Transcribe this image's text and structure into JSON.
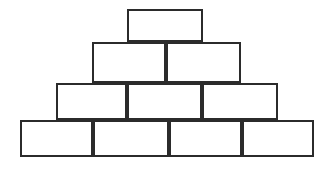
{
  "figure": {
    "name": "brick-pyramid",
    "background_color": "#ffffff",
    "stroke_color": "#2b2b2b",
    "fill_color": "#ffffff",
    "stroke_width": 2,
    "width": 330,
    "height": 169,
    "row_count": 4,
    "brick_count": 10
  },
  "chart_data": {
    "type": "diagram",
    "background_color": "#ffffff",
    "stroke_color": "#2b2b2b",
    "fill_color": "#ffffff",
    "stroke_width": 2,
    "rows": [
      {
        "index": 1,
        "label": "row-1-top",
        "brick_count": 1,
        "y_top": 9,
        "y_bottom": 42,
        "height": 33,
        "x_left": 127,
        "x_right": 203,
        "dividers": [],
        "bricks": [
          {
            "id": "r1b1",
            "x": 127,
            "y": 9,
            "width": 76,
            "height": 33
          }
        ]
      },
      {
        "index": 2,
        "label": "row-2",
        "brick_count": 2,
        "y_top": 42,
        "y_bottom": 83,
        "height": 41,
        "x_left": 92,
        "x_right": 241,
        "dividers": [
          166
        ],
        "bricks": [
          {
            "id": "r2b1",
            "x": 92,
            "y": 42,
            "width": 74,
            "height": 41
          },
          {
            "id": "r2b2",
            "x": 166,
            "y": 42,
            "width": 75,
            "height": 41
          }
        ]
      },
      {
        "index": 3,
        "label": "row-3",
        "brick_count": 3,
        "y_top": 83,
        "y_bottom": 120,
        "height": 37,
        "x_left": 56,
        "x_right": 278,
        "dividers": [
          127,
          202
        ],
        "bricks": [
          {
            "id": "r3b1",
            "x": 56,
            "y": 83,
            "width": 71,
            "height": 37
          },
          {
            "id": "r3b2",
            "x": 127,
            "y": 83,
            "width": 75,
            "height": 37
          },
          {
            "id": "r3b3",
            "x": 202,
            "y": 83,
            "width": 76,
            "height": 37
          }
        ]
      },
      {
        "index": 4,
        "label": "row-4-base",
        "brick_count": 4,
        "y_top": 120,
        "y_bottom": 157,
        "height": 37,
        "x_left": 20,
        "x_right": 314,
        "dividers": [
          93,
          169,
          242
        ],
        "bricks": [
          {
            "id": "r4b1",
            "x": 20,
            "y": 120,
            "width": 73,
            "height": 37
          },
          {
            "id": "r4b2",
            "x": 93,
            "y": 120,
            "width": 76,
            "height": 37
          },
          {
            "id": "r4b3",
            "x": 169,
            "y": 120,
            "width": 73,
            "height": 37
          },
          {
            "id": "r4b4",
            "x": 242,
            "y": 120,
            "width": 72,
            "height": 37
          }
        ]
      }
    ]
  }
}
